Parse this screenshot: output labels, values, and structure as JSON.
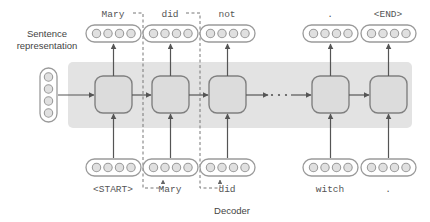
{
  "diagram": {
    "labels": {
      "sentence_representation": "Sentence\nrepresentation",
      "sentence_representation_line1": "Sentence",
      "sentence_representation_line2": "representation",
      "decoder": "Decoder"
    },
    "colors": {
      "band_fill": "#e3e3e3",
      "cell_fill": "#dcdcdc",
      "cell_stroke": "#808080",
      "vector_fill": "#ffffff",
      "vector_stroke": "#9a9a9a",
      "circle_fill": "#e0e0e0",
      "circle_stroke": "#9a9a9a",
      "arrow": "#555555",
      "dashed": "#777777",
      "text": "#555555",
      "background": "#ffffff"
    },
    "outputs": [
      {
        "label": "Mary",
        "x": 113,
        "cells": 4
      },
      {
        "label": "did",
        "x": 170,
        "cells": 4
      },
      {
        "label": "not",
        "x": 227,
        "cells": 4
      },
      {
        "label": ".",
        "x": 330,
        "cells": 4
      },
      {
        "label": "<END>",
        "x": 388,
        "cells": 4
      }
    ],
    "inputs": [
      {
        "label": "<START>",
        "x": 113,
        "cells": 4
      },
      {
        "label": "Mary",
        "x": 170,
        "cells": 4
      },
      {
        "label": "did",
        "x": 227,
        "cells": 4
      },
      {
        "label": "witch",
        "x": 330,
        "cells": 4
      },
      {
        "label": ".",
        "x": 388,
        "cells": 4
      }
    ],
    "cells": [
      {
        "x": 113
      },
      {
        "x": 170
      },
      {
        "x": 227
      },
      {
        "x": 330
      },
      {
        "x": 388
      }
    ],
    "sentence_vector": {
      "cells": 4,
      "x": 48,
      "y": 95
    },
    "ellipsis": {
      "dots": 3
    },
    "band": {
      "x": 68,
      "y": 62,
      "width": 344,
      "height": 66
    }
  }
}
